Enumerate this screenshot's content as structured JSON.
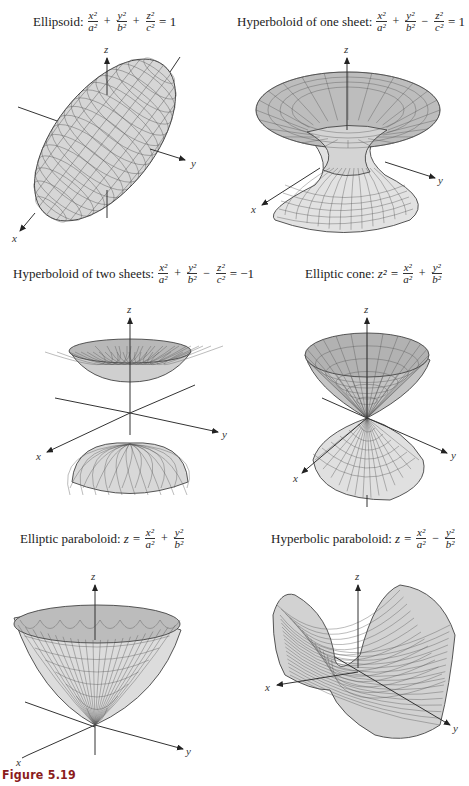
{
  "figure_caption": "Figure 5.19",
  "panels": [
    {
      "name": "Ellipsoid",
      "label": "Ellipsoid:",
      "equation": {
        "terms": [
          {
            "num": "x²",
            "den": "a²"
          },
          {
            "op": "+"
          },
          {
            "num": "y²",
            "den": "b²"
          },
          {
            "op": "+"
          },
          {
            "num": "z²",
            "den": "c²"
          }
        ],
        "rhs": "= 1"
      },
      "axes": {
        "x": "x",
        "y": "y",
        "z": "z"
      }
    },
    {
      "name": "Hyperboloid of one sheet",
      "label": "Hyperboloid of one sheet:",
      "equation": {
        "terms": [
          {
            "num": "x²",
            "den": "a²"
          },
          {
            "op": "+"
          },
          {
            "num": "y²",
            "den": "b²"
          },
          {
            "op": "−"
          },
          {
            "num": "z²",
            "den": "c²"
          }
        ],
        "rhs": "= 1"
      },
      "axes": {
        "x": "x",
        "y": "y",
        "z": "z"
      }
    },
    {
      "name": "Hyperboloid of two sheets",
      "label": "Hyperboloid of two sheets:",
      "equation": {
        "terms": [
          {
            "num": "x²",
            "den": "a²"
          },
          {
            "op": "+"
          },
          {
            "num": "y²",
            "den": "b²"
          },
          {
            "op": "−"
          },
          {
            "num": "z²",
            "den": "c²"
          }
        ],
        "rhs": "= −1"
      },
      "axes": {
        "x": "x",
        "y": "y",
        "z": "z"
      }
    },
    {
      "name": "Elliptic cone",
      "label": "Elliptic cone:",
      "lhs": "z² =",
      "equation": {
        "terms": [
          {
            "num": "x²",
            "den": "a²"
          },
          {
            "op": "+"
          },
          {
            "num": "y²",
            "den": "b²"
          }
        ],
        "rhs": ""
      },
      "axes": {
        "x": "x",
        "y": "y",
        "z": "z"
      }
    },
    {
      "name": "Elliptic paraboloid",
      "label": "Elliptic paraboloid:",
      "lhs": "z =",
      "equation": {
        "terms": [
          {
            "num": "x²",
            "den": "a²"
          },
          {
            "op": "+"
          },
          {
            "num": "y²",
            "den": "b²"
          }
        ],
        "rhs": ""
      },
      "axes": {
        "x": "x",
        "y": "y",
        "z": "z"
      }
    },
    {
      "name": "Hyperbolic paraboloid",
      "label": "Hyperbolic paraboloid:",
      "lhs": "z =",
      "equation": {
        "terms": [
          {
            "num": "x²",
            "den": "a²"
          },
          {
            "op": "−"
          },
          {
            "num": "y²",
            "den": "b²"
          }
        ],
        "rhs": ""
      },
      "axes": {
        "x": "x",
        "y": "y",
        "z": "z"
      }
    }
  ],
  "colors": {
    "caption": "#8b1c1c",
    "surface_fill": "#d9d9d9",
    "surface_dark": "#b5b5b5",
    "mesh": "#555555"
  }
}
